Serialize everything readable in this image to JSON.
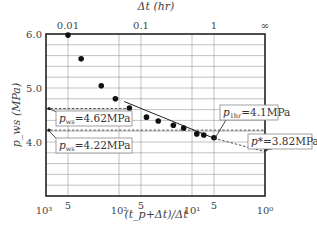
{
  "chart_data": {
    "type": "scatter",
    "title": "",
    "xlabel": "(t_p+Δt)/Δt",
    "ylabel": "p_ws (MPa)",
    "top_xlabel": "Δt (hr)",
    "x_scale": "log",
    "x_reversed": true,
    "xlim": [
      1000,
      1
    ],
    "ylim": [
      3.0,
      6.0
    ],
    "grid": true,
    "x_ticks": [
      {
        "value": 1000,
        "label": "10³"
      },
      {
        "value": 500,
        "label": "5"
      },
      {
        "value": 100,
        "label": "10²"
      },
      {
        "value": 50,
        "label": "5"
      },
      {
        "value": 10,
        "label": "10¹"
      },
      {
        "value": 5,
        "label": "5"
      },
      {
        "value": 1,
        "label": "10⁰"
      }
    ],
    "top_x_ticks": [
      {
        "at_bottom_value": 500,
        "label": "0.01"
      },
      {
        "at_bottom_value": 50,
        "label": "0.1"
      },
      {
        "at_bottom_value": 5,
        "label": "1"
      },
      {
        "at_bottom_value": 1,
        "label": "∞"
      }
    ],
    "y_ticks": [
      {
        "value": 6.0,
        "label": "6.0"
      },
      {
        "value": 5.0,
        "label": "5.0"
      },
      {
        "value": 4.0,
        "label": "4.0"
      }
    ],
    "y_minor_step": 0.2,
    "series": [
      {
        "name": "measured p_ws",
        "points": [
          {
            "x": 500,
            "y": 5.98
          },
          {
            "x": 330,
            "y": 5.54
          },
          {
            "x": 175,
            "y": 5.04
          },
          {
            "x": 112,
            "y": 4.8
          },
          {
            "x": 72,
            "y": 4.63
          },
          {
            "x": 42,
            "y": 4.46
          },
          {
            "x": 29,
            "y": 4.39
          },
          {
            "x": 18,
            "y": 4.31
          },
          {
            "x": 13,
            "y": 4.26
          },
          {
            "x": 8.6,
            "y": 4.15
          },
          {
            "x": 6.9,
            "y": 4.13
          },
          {
            "x": 5.0,
            "y": 4.08
          }
        ]
      }
    ],
    "lines": [
      {
        "name": "straight-line fit",
        "style": "solid",
        "from": {
          "x": 85,
          "y": 4.75
        },
        "to": {
          "x": 5,
          "y": 4.07
        }
      },
      {
        "name": "extrapolation to p*",
        "style": "dashed",
        "from": {
          "x": 5,
          "y": 4.07
        },
        "to": {
          "x": 1,
          "y": 3.82
        }
      },
      {
        "name": "p_ws 4.62 level",
        "style": "dashed",
        "from": {
          "x": 1000,
          "y": 4.62
        },
        "to": {
          "x": 72,
          "y": 4.62
        }
      },
      {
        "name": "p_ws 4.22 level",
        "style": "dashed",
        "from": {
          "x": 1000,
          "y": 4.22
        },
        "to": {
          "x": 1,
          "y": 4.22
        }
      }
    ],
    "annotations": [
      {
        "id": "pws1",
        "sym": "p",
        "sub": "ws",
        "text": "=4.62MPa",
        "points_to": {
          "x": 1000,
          "y": 4.62
        }
      },
      {
        "id": "pws2",
        "sym": "p",
        "sub": "ws",
        "text": "=4.22MPa",
        "points_to": {
          "x": 1000,
          "y": 4.22
        }
      },
      {
        "id": "p1hr",
        "sym": "p",
        "sub": "1hr",
        "text": "=4.1MPa",
        "points_to": {
          "x": 5,
          "y": 4.07
        }
      },
      {
        "id": "pstar",
        "sym": "p",
        "sub": "",
        "text": "*=3.82MPa",
        "points_to": {
          "x": 1,
          "y": 3.82
        }
      }
    ]
  }
}
